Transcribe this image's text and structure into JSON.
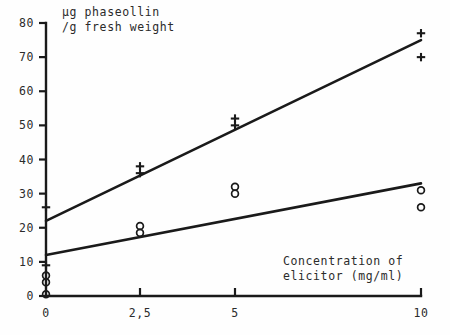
{
  "chart_data": {
    "type": "scatter",
    "title": "",
    "subtitle": "",
    "xlabel": "Concentration of elicitor (mg/ml)",
    "xlabel_lines": [
      "Concentration of",
      "elicitor (mg/ml)"
    ],
    "ylabel": "µg phaseollin /g fresh weight",
    "ylabel_lines": [
      "µg phaseollin",
      "/g fresh weight"
    ],
    "xlim": [
      0,
      10
    ],
    "ylim": [
      0,
      80
    ],
    "grid": false,
    "legend": "none",
    "x_ticks": [
      {
        "value": 0,
        "label": "0"
      },
      {
        "value": 2.5,
        "label": "2,5"
      },
      {
        "value": 5,
        "label": "5"
      },
      {
        "value": 10,
        "label": "10"
      }
    ],
    "y_ticks": [
      {
        "value": 0,
        "label": "0"
      },
      {
        "value": 10,
        "label": "10"
      },
      {
        "value": 20,
        "label": "20"
      },
      {
        "value": 30,
        "label": "30"
      },
      {
        "value": 40,
        "label": "40"
      },
      {
        "value": 50,
        "label": "50"
      },
      {
        "value": 60,
        "label": "60"
      },
      {
        "value": 70,
        "label": "70"
      },
      {
        "value": 80,
        "label": "80"
      }
    ],
    "series": [
      {
        "name": "plus-series",
        "marker": "plus",
        "points": [
          {
            "x": 0,
            "y": 9
          },
          {
            "x": 0,
            "y": 26
          },
          {
            "x": 2.5,
            "y": 38
          },
          {
            "x": 2.5,
            "y": 36
          },
          {
            "x": 5,
            "y": 52
          },
          {
            "x": 5,
            "y": 50
          },
          {
            "x": 10,
            "y": 77
          },
          {
            "x": 10,
            "y": 70
          }
        ],
        "fit_line": {
          "x1": 0,
          "y1": 22,
          "x2": 10,
          "y2": 75
        }
      },
      {
        "name": "circle-series",
        "marker": "circle",
        "points": [
          {
            "x": 0,
            "y": 6
          },
          {
            "x": 0,
            "y": 4
          },
          {
            "x": 0,
            "y": 0.5
          },
          {
            "x": 2.5,
            "y": 20.5
          },
          {
            "x": 2.5,
            "y": 18.5
          },
          {
            "x": 5,
            "y": 32
          },
          {
            "x": 5,
            "y": 30
          },
          {
            "x": 10,
            "y": 31
          },
          {
            "x": 10,
            "y": 26
          }
        ],
        "fit_line": {
          "x1": 0,
          "y1": 12,
          "x2": 10,
          "y2": 33
        }
      }
    ],
    "colors": {
      "ink": "#1a1a1a",
      "background": "#fefefe"
    }
  }
}
